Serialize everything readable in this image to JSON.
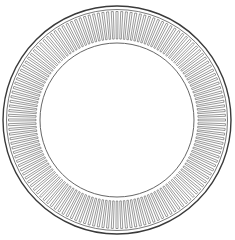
{
  "figure": {
    "kind": "slotted-ring",
    "center": [
      117,
      120
    ],
    "outer_radius": 114,
    "ring_radius": 110.5,
    "slot_outer_radius": 108.5,
    "slot_inner_radius": 81,
    "inner_radius": 77,
    "slot_count": 144,
    "slot_half_width_deg": 0.55,
    "colors": {
      "outer_stroke": "#3a3a3a",
      "line_stroke": "#555555",
      "background": "#ffffff"
    }
  }
}
